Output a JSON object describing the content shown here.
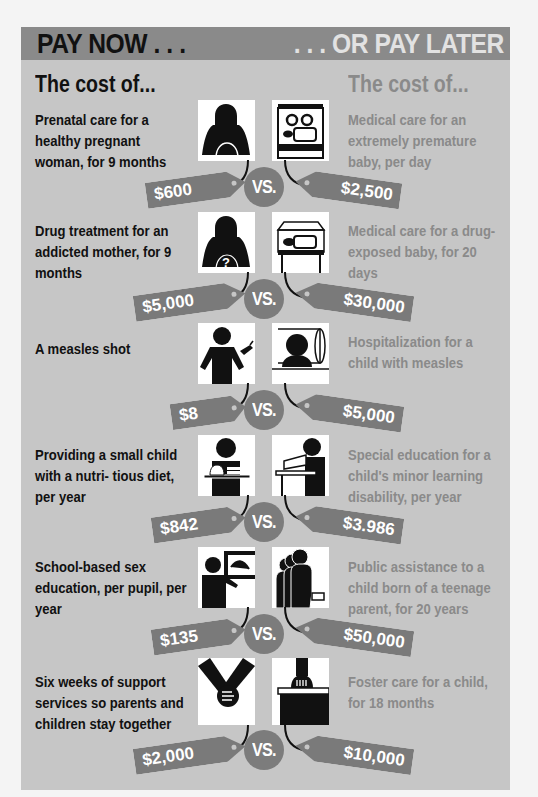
{
  "header": {
    "left_title": "PAY NOW . . .",
    "right_title": ". . . OR PAY LATER"
  },
  "columns": {
    "left_heading": "The cost of...",
    "right_heading": "The cost of..."
  },
  "vs_label": "VS.",
  "colors": {
    "panel_bg": "#c6c6c6",
    "header_bg": "#8a8a8a",
    "tag_bg": "#7a7a7a",
    "left_text": "#111111",
    "right_text": "#8a8a8a"
  },
  "comparisons": [
    {
      "now_text": "Prenatal care for a healthy pregnant woman, for 9 months",
      "now_cost": "$600",
      "now_icon": "pregnant-woman-icon",
      "later_text": "Medical care for an extremely premature baby, per day",
      "later_cost": "$2,500",
      "later_icon": "incubator-icon"
    },
    {
      "now_text": "Drug treatment for an addicted mother, for 9 months",
      "now_cost": "$5,000",
      "now_icon": "addicted-mother-icon",
      "later_text": "Medical care for a drug-exposed baby, for 20 days",
      "later_cost": "$30,000",
      "later_icon": "hospital-crib-icon"
    },
    {
      "now_text": "A measles shot",
      "now_cost": "$8",
      "now_icon": "child-vaccine-icon",
      "later_text": "Hospitalization for a child with measles",
      "later_cost": "$5,000",
      "later_icon": "hospitalized-child-icon"
    },
    {
      "now_text": "Providing a small child with a nutritious diet, per year",
      "now_text_display": "Providing a small child with a nutri- tious diet, per year",
      "now_cost": "$842",
      "now_icon": "child-food-tray-icon",
      "later_text": "Special education for a child's minor learning disability, per year",
      "later_cost": "$3.986",
      "later_icon": "student-desk-icon"
    },
    {
      "now_text": "School-based sex education, per pupil, per year",
      "now_cost": "$135",
      "now_icon": "teacher-board-icon",
      "later_text": "Public assistance to a child born of a teenage parent, for 20 years",
      "later_cost": "$50,000",
      "later_icon": "family-money-icon"
    },
    {
      "now_text": "Six weeks of support services so parents and children stay together",
      "now_cost": "$2,000",
      "now_icon": "holding-hands-icon",
      "later_text": "Foster care for a child, for 18 months",
      "later_cost": "$10,000",
      "later_icon": "suitcase-icon"
    }
  ]
}
